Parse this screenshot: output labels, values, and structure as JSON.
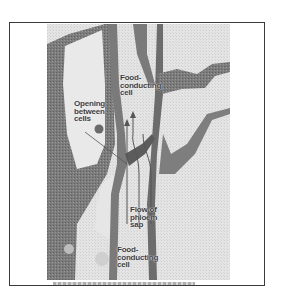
{
  "figure": {
    "labels": {
      "top_cell": "Food-\nconducting\ncell",
      "opening": "Opening\nbetween\ncells",
      "flow": "Flow of\nphloem\nsap",
      "bottom_cell": "Food-\nconducting\ncell"
    },
    "caption": ""
  },
  "colors": {
    "frame": "#3a3a3a",
    "cell_wall": "#6e6e6e",
    "cytoplasm": "#8a8a8a",
    "lumen": "#e8e8e8",
    "background": "#ffffff"
  }
}
